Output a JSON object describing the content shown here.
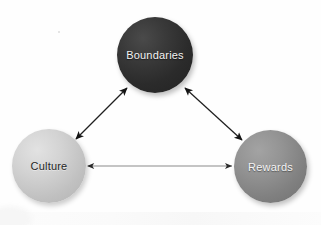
{
  "diagram": {
    "background_color": "#fefefe",
    "nodes": [
      {
        "id": "boundaries",
        "label": "Boundaries",
        "shape": "circle",
        "fill_color": "#2b2b2b",
        "text_color": "#f2f2f2",
        "position": "top-center",
        "center_x": 155,
        "center_y": 55,
        "diameter": 76
      },
      {
        "id": "culture",
        "label": "Culture",
        "shape": "circle",
        "fill_color": "#c8c8c8",
        "text_color": "#262626",
        "position": "bottom-left",
        "center_x": 49,
        "center_y": 166,
        "diameter": 74
      },
      {
        "id": "rewards",
        "label": "Rewards",
        "shape": "circle",
        "fill_color": "#878787",
        "text_color": "#f4f4f4",
        "position": "bottom-right",
        "center_x": 270,
        "center_y": 166,
        "diameter": 73
      }
    ],
    "edges": [
      {
        "id": "culture-boundaries",
        "from": "culture",
        "to": "boundaries",
        "style": "double-headed-arrow",
        "color": "#1a1a1a"
      },
      {
        "id": "boundaries-rewards",
        "from": "boundaries",
        "to": "rewards",
        "style": "double-headed-arrow",
        "color": "#1a1a1a"
      },
      {
        "id": "culture-rewards",
        "from": "culture",
        "to": "rewards",
        "style": "double-headed-arrow",
        "color": "#6e6e6e"
      }
    ]
  }
}
